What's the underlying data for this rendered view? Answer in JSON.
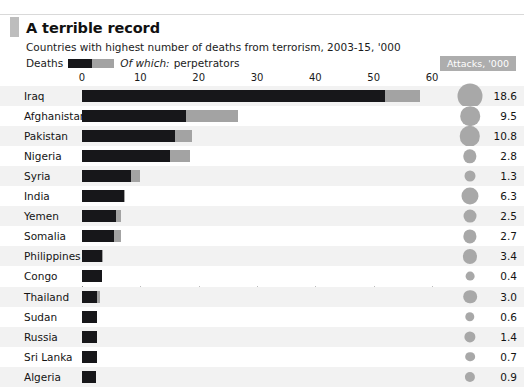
{
  "header": {
    "title": "A terrible record",
    "subtitle": "Countries with highest number of deaths from terrorism, 2003-15, '000",
    "legend_deaths_label": "Deaths",
    "legend_ofwhich_label": "Of which:",
    "legend_perpetrators_label": "perpetrators",
    "attacks_badge": "Attacks, '000"
  },
  "colors": {
    "deaths": "#17171a",
    "perpetrators": "#a3a3a3",
    "bubble": "#a8a8a8",
    "badge": "#adadad",
    "stripe": "#f2f2f2",
    "gridline": "#bbbbbb"
  },
  "chart_data": {
    "type": "bar",
    "title": "A terrible record",
    "subtitle": "Countries with highest number of deaths from terrorism, 2003-15, '000",
    "xlabel": "",
    "ylabel": "",
    "xlim": [
      0,
      60
    ],
    "xticks": [
      0,
      10,
      20,
      30,
      40,
      50,
      60
    ],
    "xtick_labels": [
      "0",
      "10",
      "20",
      "30",
      "40",
      "50",
      "60"
    ],
    "grid": true,
    "orientation": "horizontal",
    "stacked": true,
    "legend": [
      "Deaths",
      "Of which: perpetrators"
    ],
    "legend_position": "top-left",
    "categories": [
      "Iraq",
      "Afghanistan",
      "Pakistan",
      "Nigeria",
      "Syria",
      "India",
      "Yemen",
      "Somalia",
      "Philippines",
      "Congo",
      "Thailand",
      "Sudan",
      "Russia",
      "Sri Lanka",
      "Algeria"
    ],
    "series": [
      {
        "name": "Deaths excluding perpetrators",
        "values": [
          52.0,
          17.8,
          16.0,
          15.0,
          8.4,
          7.2,
          5.8,
          5.5,
          3.4,
          3.4,
          2.6,
          2.6,
          2.6,
          2.6,
          2.4
        ]
      },
      {
        "name": "Of which: perpetrators",
        "values": [
          6.0,
          8.9,
          2.8,
          3.5,
          1.6,
          0.2,
          0.9,
          1.2,
          0.2,
          0.0,
          0.5,
          0.0,
          0.0,
          0.0,
          0.0
        ]
      }
    ],
    "totals": [
      58.0,
      26.7,
      18.8,
      18.5,
      10.0,
      7.4,
      6.7,
      6.7,
      3.6,
      3.4,
      3.1,
      2.6,
      2.6,
      2.6,
      2.4
    ],
    "bubble_series": {
      "name": "Attacks, '000",
      "values": [
        18.6,
        9.5,
        10.8,
        2.8,
        1.3,
        6.3,
        2.5,
        2.7,
        3.4,
        0.4,
        3.0,
        0.6,
        1.4,
        0.7,
        0.9
      ]
    }
  }
}
